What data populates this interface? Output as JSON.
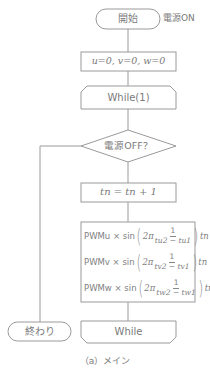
{
  "diagram": {
    "type": "flowchart",
    "colors": {
      "line": "#9a9a9a",
      "text": "#7a7a7a",
      "background": "#ffffff"
    },
    "nodes": [
      {
        "id": "start",
        "shape": "terminal",
        "label": "開始",
        "annotation": "電源ON"
      },
      {
        "id": "init",
        "shape": "process",
        "label": "u=0, v=0, w=0"
      },
      {
        "id": "loop_start",
        "shape": "loop-limit-start",
        "label": "While(1)"
      },
      {
        "id": "decision",
        "shape": "decision",
        "label": "電源OFF？"
      },
      {
        "id": "increment",
        "shape": "process",
        "label": "tn = tn + 1"
      },
      {
        "id": "pwm",
        "shape": "process",
        "lines": [
          {
            "prefix": "PWMu × sin",
            "coef": "2π",
            "num": "1",
            "den": "tu2 − tu1",
            "suffix": "tn"
          },
          {
            "prefix": "PWMv × sin",
            "coef": "2π",
            "num": "1",
            "den": "tv2 − tv1",
            "suffix": "tn"
          },
          {
            "prefix": "PWMw × sin",
            "coef": "2π",
            "num": "1",
            "den": "tw2 − tw1",
            "suffix": "tn"
          }
        ]
      },
      {
        "id": "loop_end",
        "shape": "loop-limit-end",
        "label": "While"
      },
      {
        "id": "end",
        "shape": "terminal",
        "label": "終わり"
      }
    ],
    "edges": [
      [
        "start",
        "init"
      ],
      [
        "init",
        "loop_start"
      ],
      [
        "loop_start",
        "decision"
      ],
      [
        "decision",
        "increment"
      ],
      [
        "increment",
        "pwm"
      ],
      [
        "pwm",
        "loop_end"
      ],
      [
        "decision",
        "end"
      ]
    ],
    "caption": "（a）メイン"
  }
}
